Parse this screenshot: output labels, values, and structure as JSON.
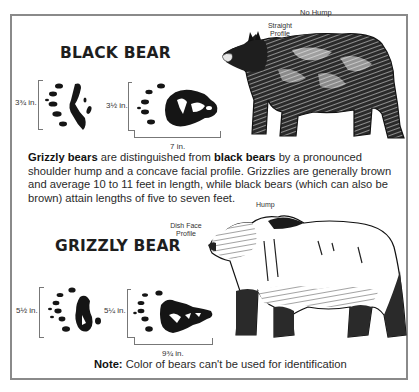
{
  "black_bear": {
    "title": "BLACK BEAR",
    "profile_label_line1": "Straight",
    "profile_label_line2": "Profile",
    "hump_label": "No Hump",
    "front_track_length": "3¾ in.",
    "hind_track_width": "3½ in.",
    "hind_track_length": "7 in."
  },
  "description": {
    "bold1": "Grizzly bears",
    "text1": " are distinguished from ",
    "bold2": "black bears",
    "text2": " by a pronounced shoulder hump and a concave facial profile. Grizzlies are generally brown and average 10 to 11 feet in length, while black bears (which can also be brown) attain lengths of five to seven feet."
  },
  "grizzly_bear": {
    "title": "GRIZZLY BEAR",
    "profile_label_line1": "Dish Face",
    "profile_label_line2": "Profile",
    "hump_label": "Hump",
    "front_track_length": "5½ in.",
    "hind_track_width": "5¼ in.",
    "hind_track_length": "9¾ in."
  },
  "note": {
    "label": "Note:",
    "text": " Color of bears can't be used for identification"
  },
  "colors": {
    "border": "#8a8a8a",
    "ink": "#1a1a1a",
    "text": "#2a2a2a"
  }
}
